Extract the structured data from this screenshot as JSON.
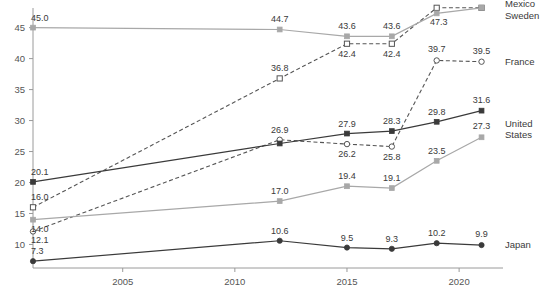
{
  "chart_data": {
    "type": "line",
    "title": "",
    "xlabel": "",
    "ylabel": "",
    "x": [
      2001,
      2012,
      2015,
      2017,
      2019,
      2021
    ],
    "xlim": [
      2001,
      2021.6
    ],
    "ylim": [
      6.2,
      47.2
    ],
    "xticks": [
      2005,
      2010,
      2015,
      2020
    ],
    "xtick_labels": [
      "2005",
      "2010",
      "2015",
      "2020"
    ],
    "yticks": [
      10,
      15,
      20,
      25,
      30,
      35,
      40,
      45
    ],
    "ytick_labels": [
      "10",
      "15",
      "20",
      "25",
      "30",
      "35",
      "40",
      "45"
    ],
    "grid": false,
    "legend_position": "right-inline",
    "series": [
      {
        "name": "Mexico",
        "color": "#555555",
        "linestyle": "dashed",
        "marker": "open-square",
        "values": [
          16.0,
          36.8,
          42.4,
          42.4,
          48.2,
          48.2
        ],
        "labels": [
          "16.0",
          "36.8",
          "42.4",
          "42.4",
          "48.2",
          "48.2"
        ]
      },
      {
        "name": "Sweden",
        "color": "#a8a8a8",
        "linestyle": "solid",
        "marker": "filled-square",
        "values": [
          45.0,
          44.7,
          43.6,
          43.6,
          47.3,
          48.2
        ],
        "labels": [
          "45.0",
          "44.7",
          "43.6",
          "43.6",
          "47.3",
          ""
        ]
      },
      {
        "name": "France",
        "color": "#555555",
        "linestyle": "dashed",
        "marker": "open-circle",
        "values": [
          12.1,
          26.9,
          26.2,
          25.8,
          39.7,
          39.5
        ],
        "labels": [
          "12.1",
          "26.9",
          "26.2",
          "25.8",
          "39.7",
          "39.5"
        ]
      },
      {
        "name": "United States",
        "color": "#3a3a3a",
        "linestyle": "solid",
        "marker": "filled-square",
        "values": [
          20.1,
          26.3,
          27.9,
          28.3,
          29.8,
          31.6
        ],
        "labels": [
          "20.1",
          "",
          "27.9",
          "28.3",
          "29.8",
          "31.6"
        ]
      },
      {
        "name": "United States",
        "color": "#a8a8a8",
        "linestyle": "solid",
        "marker": "filled-square",
        "values": [
          14.0,
          17.0,
          19.4,
          19.1,
          23.5,
          27.3
        ],
        "labels": [
          "14.0",
          "17.0",
          "19.4",
          "19.1",
          "23.5",
          "27.3"
        ]
      },
      {
        "name": "Japan",
        "color": "#3a3a3a",
        "linestyle": "solid",
        "marker": "filled-circle",
        "values": [
          7.3,
          10.6,
          9.5,
          9.3,
          10.2,
          9.9
        ],
        "labels": [
          "7.3",
          "10.6",
          "9.5",
          "9.3",
          "10.2",
          "9.9"
        ]
      }
    ],
    "legend_entries": [
      {
        "label": "Mexico"
      },
      {
        "label": "Sweden"
      },
      {
        "label": "France"
      },
      {
        "label": "United",
        "label2": "States"
      },
      {
        "label": "Japan"
      }
    ]
  }
}
